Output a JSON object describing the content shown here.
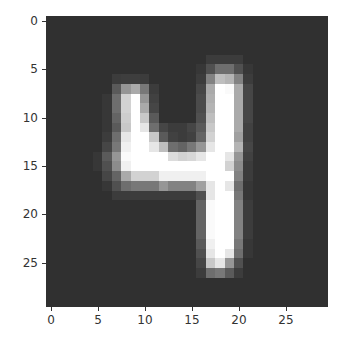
{
  "chart_data": {
    "type": "heatmap",
    "title": "",
    "xlabel": "",
    "ylabel": "",
    "colormap": "gray",
    "xlim": [
      -0.5,
      29.5
    ],
    "ylim": [
      29.5,
      -0.5
    ],
    "x_ticks": [
      0,
      5,
      10,
      15,
      20,
      25
    ],
    "y_ticks": [
      0,
      5,
      10,
      15,
      20,
      25
    ],
    "shape": [
      30,
      30
    ],
    "background_value": 48,
    "nonzero_cells": {
      "4": {
        "17": 60,
        "18": 60,
        "19": 60,
        "20": 60
      },
      "5": {
        "16": 55,
        "17": 80,
        "18": 110,
        "19": 110,
        "20": 80,
        "21": 55
      },
      "6": {
        "7": 60,
        "8": 62,
        "9": 62,
        "10": 60,
        "16": 60,
        "17": 130,
        "18": 190,
        "19": 180,
        "20": 130,
        "21": 60
      },
      "7": {
        "7": 90,
        "8": 150,
        "9": 170,
        "10": 120,
        "11": 60,
        "16": 70,
        "17": 170,
        "18": 255,
        "19": 250,
        "20": 170,
        "21": 70
      },
      "8": {
        "6": 55,
        "7": 110,
        "8": 210,
        "9": 255,
        "10": 150,
        "11": 65,
        "16": 75,
        "17": 175,
        "18": 255,
        "19": 255,
        "20": 170,
        "21": 70
      },
      "9": {
        "6": 55,
        "7": 110,
        "8": 210,
        "9": 255,
        "10": 170,
        "11": 70,
        "16": 75,
        "17": 180,
        "18": 255,
        "19": 255,
        "20": 170,
        "21": 70
      },
      "10": {
        "6": 55,
        "7": 100,
        "8": 205,
        "9": 255,
        "10": 200,
        "11": 90,
        "16": 80,
        "17": 190,
        "18": 255,
        "19": 255,
        "20": 170,
        "21": 70
      },
      "11": {
        "6": 55,
        "7": 90,
        "8": 200,
        "9": 255,
        "10": 230,
        "11": 110,
        "12": 70,
        "13": 60,
        "14": 60,
        "15": 70,
        "16": 90,
        "17": 200,
        "18": 255,
        "19": 255,
        "20": 170,
        "21": 65
      },
      "12": {
        "6": 60,
        "7": 110,
        "8": 230,
        "9": 255,
        "10": 255,
        "11": 200,
        "12": 90,
        "13": 65,
        "14": 60,
        "15": 65,
        "16": 100,
        "17": 210,
        "18": 255,
        "19": 255,
        "20": 160,
        "21": 65
      },
      "13": {
        "6": 70,
        "7": 120,
        "8": 240,
        "9": 255,
        "10": 255,
        "11": 230,
        "12": 190,
        "13": 110,
        "14": 100,
        "15": 120,
        "16": 150,
        "17": 230,
        "18": 255,
        "19": 255,
        "20": 180,
        "21": 70
      },
      "14": {
        "5": 55,
        "6": 90,
        "7": 150,
        "8": 250,
        "9": 255,
        "10": 255,
        "11": 255,
        "12": 255,
        "13": 220,
        "14": 210,
        "15": 215,
        "16": 230,
        "17": 255,
        "18": 255,
        "19": 230,
        "20": 150,
        "21": 65
      },
      "15": {
        "5": 55,
        "6": 80,
        "7": 140,
        "8": 240,
        "9": 255,
        "10": 255,
        "11": 255,
        "12": 255,
        "13": 255,
        "14": 255,
        "15": 255,
        "16": 255,
        "17": 255,
        "18": 255,
        "19": 210,
        "20": 140,
        "21": 60
      },
      "16": {
        "6": 70,
        "7": 100,
        "8": 170,
        "9": 210,
        "10": 210,
        "11": 210,
        "12": 240,
        "13": 240,
        "14": 240,
        "15": 240,
        "16": 240,
        "17": 255,
        "18": 255,
        "19": 255,
        "20": 130,
        "21": 60
      },
      "17": {
        "6": 55,
        "7": 80,
        "8": 110,
        "9": 120,
        "10": 120,
        "11": 120,
        "12": 150,
        "13": 130,
        "14": 130,
        "15": 130,
        "16": 160,
        "17": 230,
        "18": 255,
        "19": 230,
        "20": 110,
        "21": 55
      },
      "18": {
        "7": 60,
        "8": 60,
        "9": 60,
        "10": 60,
        "11": 60,
        "12": 60,
        "13": 60,
        "14": 60,
        "15": 60,
        "16": 80,
        "17": 230,
        "18": 255,
        "19": 255,
        "20": 120,
        "21": 55
      },
      "19": {
        "16": 100,
        "17": 250,
        "18": 255,
        "19": 255,
        "20": 130,
        "21": 60
      },
      "20": {
        "16": 100,
        "17": 250,
        "18": 255,
        "19": 255,
        "20": 130,
        "21": 60
      },
      "21": {
        "16": 100,
        "17": 250,
        "18": 255,
        "19": 255,
        "20": 130,
        "21": 60
      },
      "22": {
        "16": 100,
        "17": 250,
        "18": 255,
        "19": 255,
        "20": 130,
        "21": 60
      },
      "23": {
        "16": 90,
        "17": 240,
        "18": 255,
        "19": 255,
        "20": 120,
        "21": 55
      },
      "24": {
        "16": 80,
        "17": 230,
        "18": 255,
        "19": 230,
        "20": 110,
        "21": 55
      },
      "25": {
        "16": 70,
        "17": 200,
        "18": 230,
        "19": 150,
        "20": 80
      },
      "26": {
        "16": 60,
        "17": 110,
        "18": 120,
        "19": 90,
        "20": 60
      }
    }
  },
  "axes": {
    "x_tick_labels": [
      "0",
      "5",
      "10",
      "15",
      "20",
      "25"
    ],
    "y_tick_labels": [
      "0",
      "5",
      "10",
      "15",
      "20",
      "25"
    ]
  }
}
